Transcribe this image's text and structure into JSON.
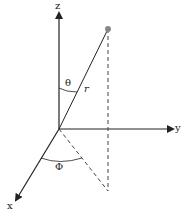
{
  "diagram": {
    "axes": {
      "z": {
        "label": "z"
      },
      "y": {
        "label": "y"
      },
      "x": {
        "label": "x"
      }
    },
    "labels": {
      "theta": "θ",
      "phi": "Φ",
      "radius": "r"
    },
    "colors": {
      "line": "#222222",
      "point": "#888888",
      "background": "#ffffff"
    }
  }
}
